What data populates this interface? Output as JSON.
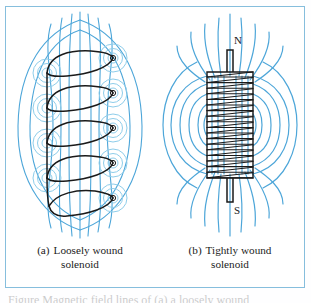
{
  "figure": {
    "frame_border_color": "#86bedd",
    "background_color": "#ffffff",
    "field_line_color": "#4da6d9",
    "field_line_color_light": "#8ecdea",
    "wire_color": "#1a1a1a",
    "label_color": "#1b1b1b"
  },
  "panels": [
    {
      "id": "loosely-wound",
      "tag": "(a)",
      "caption_line1": "Loosely wound",
      "caption_line2": "solenoid",
      "turns": 5,
      "pole_labels": []
    },
    {
      "id": "tightly-wound",
      "tag": "(b)",
      "caption_line1": "Tightly wound",
      "caption_line2": "solenoid",
      "turns": 19,
      "pole_labels": [
        {
          "name": "north-pole-label",
          "text": "N"
        },
        {
          "name": "south-pole-label",
          "text": "S"
        }
      ]
    }
  ],
  "cutoff_caption": "Figure  Magnetic field lines of (a) a loosely wound"
}
